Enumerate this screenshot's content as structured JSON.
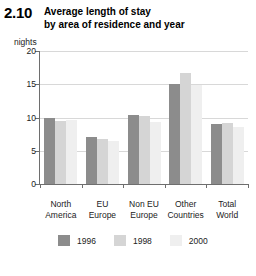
{
  "figure": {
    "number": "2.10",
    "title_line_1": "Average length of stay",
    "title_line_2": "by area of residence and year"
  },
  "chart_data": {
    "type": "bar",
    "title": "Average length of stay by area of residence and year",
    "xlabel": "",
    "ylabel": "nights",
    "unit_label": "nights",
    "ylim": [
      0,
      20
    ],
    "yticks": [
      "0",
      "5",
      "10",
      "15",
      "20"
    ],
    "grid": true,
    "legend_position": "bottom",
    "categories": [
      "North America",
      "EU Europe",
      "Non EU Europe",
      "Other Countries",
      "Total World"
    ],
    "categories_lines": [
      [
        "North",
        "America"
      ],
      [
        "EU",
        "Europe"
      ],
      [
        "Non EU",
        "Europe"
      ],
      [
        "Other",
        "Countries"
      ],
      [
        "Total",
        "World"
      ]
    ],
    "series": [
      {
        "name": "1996",
        "color": "#8c8c8c",
        "values": [
          10.0,
          7.0,
          10.4,
          15.1,
          9.0
        ]
      },
      {
        "name": "1998",
        "color": "#d5d5d5",
        "values": [
          9.5,
          6.8,
          10.3,
          16.7,
          9.2
        ]
      },
      {
        "name": "2000",
        "color": "#efefef",
        "values": [
          9.7,
          6.5,
          9.3,
          14.9,
          8.6
        ]
      }
    ]
  },
  "legend": {
    "items": [
      {
        "label": "1996",
        "color": "#8c8c8c"
      },
      {
        "label": "1998",
        "color": "#d5d5d5"
      },
      {
        "label": "2000",
        "color": "#efefef"
      }
    ]
  }
}
